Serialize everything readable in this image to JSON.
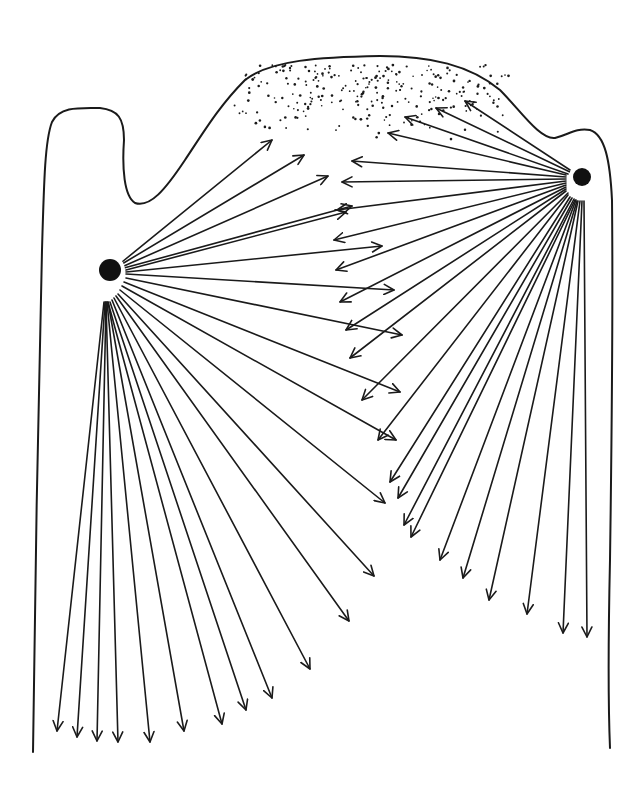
{
  "figure": {
    "width": 644,
    "height": 795,
    "background": "#ffffff",
    "stroke_color": "#1a1a1a",
    "outline_path": "M33,752 C35,600 38,400 42,250 C44,180 45,140 52,122 C60,106 80,108 100,108 C118,110 124,118 124,140 C122,168 124,196 135,203 C150,208 165,190 185,160 C205,130 220,105 245,80 C270,60 320,57 380,56 C430,56 470,65 500,90 C520,110 540,140 555,138 C570,134 575,128 590,130 C605,135 610,160 612,200 C613,300 612,420 610,560 C608,650 608,700 610,748"
  },
  "sources": [
    {
      "name": "left-source",
      "cx": 110,
      "cy": 270,
      "r": 11
    },
    {
      "name": "right-source",
      "cx": 582,
      "cy": 177,
      "r": 9
    }
  ],
  "stipple": {
    "cx": 370,
    "cy": 85,
    "rx": 140,
    "ry": 40,
    "count": 260,
    "seed": 7
  },
  "arrows": {
    "left": [
      [
        122,
        262,
        272,
        140
      ],
      [
        122,
        264,
        304,
        155
      ],
      [
        124,
        266,
        328,
        176
      ],
      [
        124,
        268,
        352,
        206
      ],
      [
        126,
        270,
        346,
        212
      ],
      [
        126,
        272,
        382,
        246
      ],
      [
        126,
        274,
        394,
        290
      ],
      [
        126,
        278,
        402,
        335
      ],
      [
        124,
        282,
        400,
        392
      ],
      [
        122,
        286,
        396,
        440
      ],
      [
        120,
        290,
        385,
        503
      ],
      [
        118,
        294,
        374,
        576
      ],
      [
        116,
        296,
        349,
        621
      ],
      [
        114,
        298,
        310,
        669
      ],
      [
        112,
        300,
        272,
        698
      ],
      [
        110,
        302,
        246,
        710
      ],
      [
        108,
        302,
        222,
        724
      ],
      [
        108,
        302,
        184,
        731
      ],
      [
        107,
        302,
        150,
        742
      ],
      [
        106,
        302,
        118,
        742
      ],
      [
        106,
        302,
        97,
        741
      ],
      [
        105,
        302,
        77,
        737
      ],
      [
        104,
        302,
        57,
        731
      ]
    ],
    "right": [
      [
        570,
        170,
        465,
        101
      ],
      [
        570,
        172,
        436,
        108
      ],
      [
        568,
        174,
        405,
        117
      ],
      [
        566,
        175,
        388,
        133
      ],
      [
        566,
        177,
        352,
        161
      ],
      [
        566,
        179,
        342,
        182
      ],
      [
        566,
        181,
        337,
        210
      ],
      [
        566,
        183,
        334,
        240
      ],
      [
        566,
        185,
        336,
        270
      ],
      [
        566,
        187,
        340,
        302
      ],
      [
        566,
        189,
        346,
        330
      ],
      [
        566,
        191,
        350,
        358
      ],
      [
        568,
        193,
        362,
        400
      ],
      [
        568,
        195,
        378,
        440
      ],
      [
        570,
        197,
        390,
        482
      ],
      [
        572,
        198,
        398,
        498
      ],
      [
        574,
        199,
        404,
        525
      ],
      [
        575,
        200,
        411,
        537
      ],
      [
        576,
        200,
        440,
        560
      ],
      [
        577,
        201,
        463,
        578
      ],
      [
        578,
        201,
        489,
        600
      ],
      [
        580,
        201,
        527,
        614
      ],
      [
        582,
        201,
        563,
        633
      ],
      [
        584,
        201,
        587,
        637
      ]
    ]
  }
}
